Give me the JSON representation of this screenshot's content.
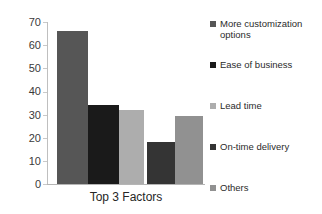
{
  "chart_data": {
    "type": "bar",
    "title": "",
    "subtitle": "",
    "xlabel": "Top 3 Factors",
    "ylabel": "",
    "categories": [
      "More customization options",
      "Ease of business",
      "Lead time",
      "On-time delivery",
      "Others"
    ],
    "values": [
      66,
      34,
      32,
      18,
      29.5
    ],
    "ylim": [
      0,
      70
    ],
    "ytick_labels": [
      "70",
      "60",
      "50",
      "40",
      "30",
      "20",
      "10",
      "0"
    ],
    "ytick_values": [
      70,
      60,
      50,
      40,
      30,
      20,
      10,
      0
    ],
    "grid": false,
    "legend_position": "right",
    "series": [
      {
        "name": "More customization options",
        "value": 66,
        "color": "#565656"
      },
      {
        "name": "Ease of business",
        "value": 34,
        "color": "#1a1a1a"
      },
      {
        "name": "Lead time",
        "value": 32,
        "color": "#adadad"
      },
      {
        "name": "On-time delivery",
        "value": 18,
        "color": "#343434"
      },
      {
        "name": "Others",
        "value": 29.5,
        "color": "#919191"
      }
    ]
  },
  "axis": {
    "y_labels": [
      "70",
      "60",
      "50",
      "40",
      "30",
      "20",
      "10",
      "0"
    ],
    "x_title": "Top 3 Factors"
  },
  "legend": {
    "items": [
      {
        "label": "More customization options",
        "color": "#565656"
      },
      {
        "label": "Ease of business",
        "color": "#1a1a1a"
      },
      {
        "label": "Lead time",
        "color": "#adadad"
      },
      {
        "label": "On-time delivery",
        "color": "#343434"
      },
      {
        "label": "Others",
        "color": "#919191"
      }
    ]
  },
  "colors": {
    "background": "#ffffff",
    "axis_line": "#bfbfbf",
    "text": "#2b2b2b"
  }
}
